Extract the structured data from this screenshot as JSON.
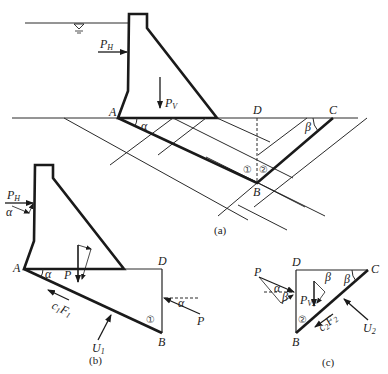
{
  "figure_a": {
    "caption": "(a)",
    "points": {
      "A": "A",
      "B": "B",
      "C": "C",
      "D": "D"
    },
    "forces": {
      "horizontal": "P",
      "horizontal_sub": "H",
      "vertical": "P",
      "vertical_sub": "V"
    },
    "angles": {
      "alpha": "α",
      "beta": "β"
    },
    "blocks": {
      "one": "①",
      "two": "②"
    }
  },
  "figure_b": {
    "caption": "(b)",
    "points": {
      "A": "A",
      "B": "B",
      "D": "D"
    },
    "forces": {
      "horizontal": "P",
      "horizontal_sub": "H",
      "resultant": "P",
      "thrust": "P",
      "uplift": "U",
      "uplift_sub": "1",
      "friction": "c",
      "friction_sub1": "1",
      "friction_F": "F",
      "friction_sub2": "1"
    },
    "angles": {
      "alpha": "α"
    },
    "block": "①"
  },
  "figure_c": {
    "caption": "(c)",
    "points": {
      "B": "B",
      "C": "C",
      "D": "D"
    },
    "forces": {
      "thrust": "P",
      "vertical": "P",
      "vertical_sub": "V2",
      "uplift": "U",
      "uplift_sub": "2",
      "friction": "c",
      "friction_sub1": "2",
      "friction_F": "F",
      "friction_sub2": "2"
    },
    "angles": {
      "alpha": "α",
      "beta": "β"
    },
    "block": "②"
  }
}
